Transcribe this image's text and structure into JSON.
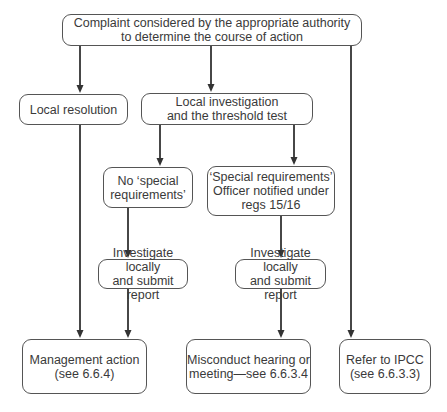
{
  "nodes": {
    "top": {
      "lines": [
        "Complaint considered by the appropriate authority",
        "to determine the course of action"
      ]
    },
    "local_resolution": {
      "lines": [
        "Local resolution"
      ]
    },
    "local_investigation": {
      "lines": [
        "Local investigation",
        "and the threshold test"
      ]
    },
    "no_special": {
      "lines": [
        "No ‘special",
        "requirements’"
      ]
    },
    "special": {
      "lines": [
        "‘Special requirements’",
        "Officer notified under",
        "regs 15/16"
      ]
    },
    "investigate_1": {
      "lines": [
        "Investigate locally",
        "and submit report"
      ]
    },
    "investigate_2": {
      "lines": [
        "Investigate locally",
        "and submit report"
      ]
    },
    "management": {
      "lines": [
        "Management action",
        "(see 6.6.4)"
      ]
    },
    "misconduct": {
      "lines": [
        "Misconduct hearing or",
        "meeting—see 6.6.3.4"
      ]
    },
    "ipcc": {
      "lines": [
        "Refer to IPCC",
        "(see 6.6.3.3)"
      ]
    }
  },
  "edges": [
    {
      "from": "top",
      "to": "local_resolution"
    },
    {
      "from": "top",
      "to": "local_investigation"
    },
    {
      "from": "top",
      "to": "ipcc"
    },
    {
      "from": "local_investigation",
      "to": "no_special"
    },
    {
      "from": "local_investigation",
      "to": "special"
    },
    {
      "from": "no_special",
      "to": "investigate_1"
    },
    {
      "from": "special",
      "to": "investigate_2"
    },
    {
      "from": "local_resolution",
      "to": "management"
    },
    {
      "from": "investigate_1",
      "to": "management"
    },
    {
      "from": "investigate_2",
      "to": "misconduct"
    }
  ]
}
